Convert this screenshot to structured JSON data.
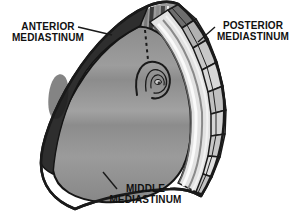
{
  "figure": {
    "type": "anatomical-diagram"
  },
  "labels": {
    "anterior": {
      "line1": "ANTERIOR",
      "line2": "MEDIASTINUM"
    },
    "posterior": {
      "line1": "POSTERIOR",
      "line2": "MEDIASTINUM"
    },
    "middle": {
      "line1": "MIDDLE",
      "line2": "MEDIASTINUM"
    }
  },
  "colors": {
    "background": "#ffffff",
    "outline": "#1a1a1a",
    "anterior_region": "#2e2e2e",
    "middle_region": "#8f8f8f",
    "stripe_band": "#e2e2e2",
    "vertebral_column": "#c6c6c6",
    "text": "#111111"
  }
}
